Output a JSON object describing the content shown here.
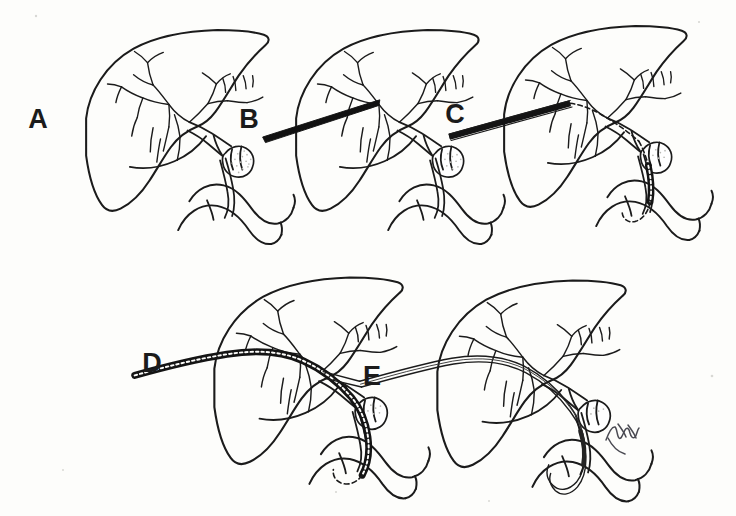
{
  "figure": {
    "kind": "medical-line-illustration",
    "technique": "pen-and-ink line drawing",
    "background_color": "#fdfdfb",
    "ink_color": "#1b1b1b",
    "panel_count": 5,
    "signature_label": "artist-signature",
    "signature_text": ""
  },
  "panels": [
    {
      "id": "A",
      "label": "A",
      "label_x": 38,
      "label_y": 128,
      "caption": "",
      "anatomy": [
        "liver",
        "intrahepatic biliary tree",
        "common bile duct",
        "gallbladder",
        "periductal mass",
        "duodenum"
      ],
      "instrument": "none",
      "stage": "baseline anatomy"
    },
    {
      "id": "B",
      "label": "B",
      "label_x": 249,
      "label_y": 128,
      "caption": "",
      "anatomy": [
        "liver",
        "intrahepatic biliary tree",
        "common bile duct",
        "gallbladder",
        "periductal mass",
        "duodenum"
      ],
      "instrument": "percutaneous needle",
      "stage": "transhepatic needle puncture"
    },
    {
      "id": "C",
      "label": "C",
      "label_x": 455,
      "label_y": 123,
      "caption": "",
      "anatomy": [
        "liver",
        "intrahepatic biliary tree",
        "common bile duct",
        "gallbladder",
        "periductal mass",
        "duodenum"
      ],
      "instrument": "guidewire through needle",
      "stage": "guidewire advanced across stricture into duodenum"
    },
    {
      "id": "D",
      "label": "D",
      "label_x": 152,
      "label_y": 372,
      "caption": "",
      "anatomy": [
        "liver",
        "intrahepatic biliary tree",
        "common bile duct",
        "gallbladder",
        "periductal mass",
        "duodenum"
      ],
      "instrument": "catheter advanced over guidewire",
      "stage": "catheter / dilator tracked over wire"
    },
    {
      "id": "E",
      "label": "E",
      "label_x": 372,
      "label_y": 385,
      "caption": "",
      "anatomy": [
        "liver",
        "intrahepatic biliary tree",
        "common bile duct",
        "gallbladder",
        "periductal mass",
        "duodenum"
      ],
      "instrument": "indwelling biliary stent / drainage tube",
      "stage": "final internal-external drainage tube in place"
    }
  ],
  "chart_data": {
    "type": "table",
    "title": "",
    "categories": [
      "A",
      "B",
      "C",
      "D",
      "E"
    ],
    "series": [
      {
        "name": "procedure stage",
        "values": [
          "baseline anatomy",
          "transhepatic needle puncture",
          "guidewire advanced into duodenum",
          "catheter over guidewire",
          "indwelling stent in place"
        ]
      }
    ]
  }
}
